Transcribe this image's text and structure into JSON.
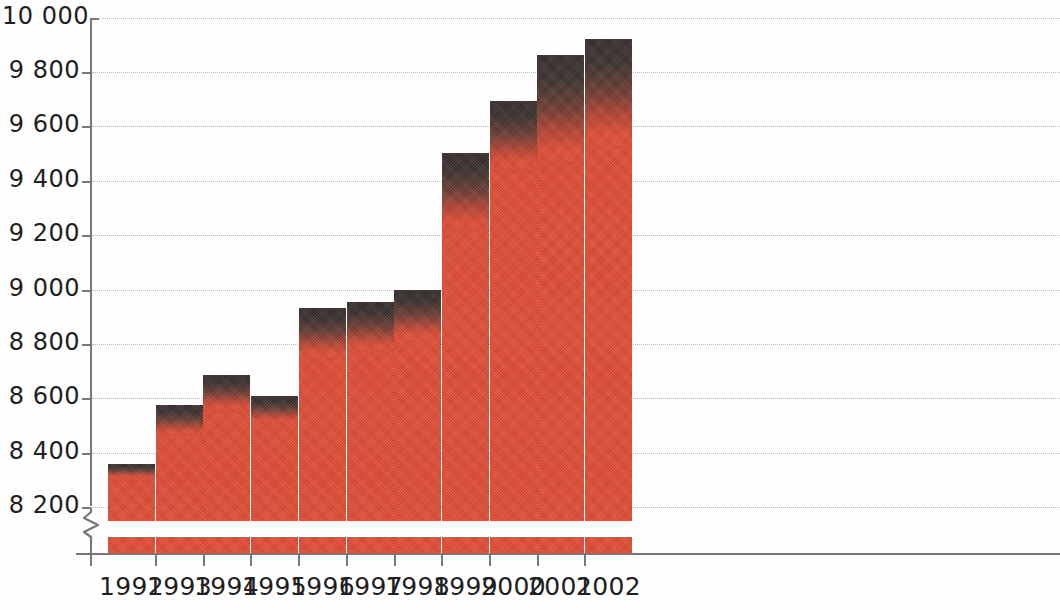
{
  "chart_data": {
    "type": "bar",
    "subtype": "stacked-vertical",
    "title": "",
    "subtitle": "",
    "xlabel": "",
    "ylabel": "",
    "categories": [
      "1992",
      "1993",
      "1994",
      "1995",
      "1996",
      "1997",
      "1998",
      "1999",
      "2000",
      "2001",
      "2002"
    ],
    "series": [
      {
        "name": "lower-segment",
        "color": "#e04b33",
        "values": [
          8305,
          8460,
          8555,
          8510,
          8745,
          8770,
          8810,
          9215,
          9440,
          9465,
          9525
        ]
      },
      {
        "name": "upper-segment",
        "color": "#332a29",
        "values": [
          8357,
          8575,
          8685,
          8607,
          8931,
          8953,
          8997,
          9502,
          9693,
          9862,
          9921
        ]
      }
    ],
    "totals": [
      8357,
      8575,
      8685,
      8607,
      8931,
      8953,
      8997,
      9502,
      9693,
      9862,
      9921
    ],
    "ylim": [
      8100,
      10000
    ],
    "y_ticks": [
      8200,
      8400,
      8600,
      8800,
      9000,
      9200,
      9400,
      9600,
      9800,
      10000
    ],
    "y_tick_labels": [
      "8 200",
      "8 400",
      "8 600",
      "8 800",
      "9 000",
      "9 200",
      "9 400",
      "9 600",
      "9 800",
      "10 000"
    ],
    "axis_break": true,
    "axis_break_label": "y-axis-break-zigzag",
    "grid": true,
    "grid_style": "dotted-horizontal",
    "grid_color": "#b9bcc3",
    "legend": null,
    "legend_position": "none",
    "background_color": "#ffffff",
    "axis_color": "#77787a",
    "text_color": "#231f20"
  },
  "axis": {
    "y_labels": [
      "10 000",
      "9 800",
      "9 600",
      "9 400",
      "9 200",
      "9 000",
      "8 800",
      "8 600",
      "8 400",
      "8 200"
    ],
    "x_labels": [
      "1992",
      "1993",
      "1994",
      "1995",
      "1996",
      "1997",
      "1998",
      "1999",
      "2000",
      "2001",
      "2002"
    ]
  }
}
